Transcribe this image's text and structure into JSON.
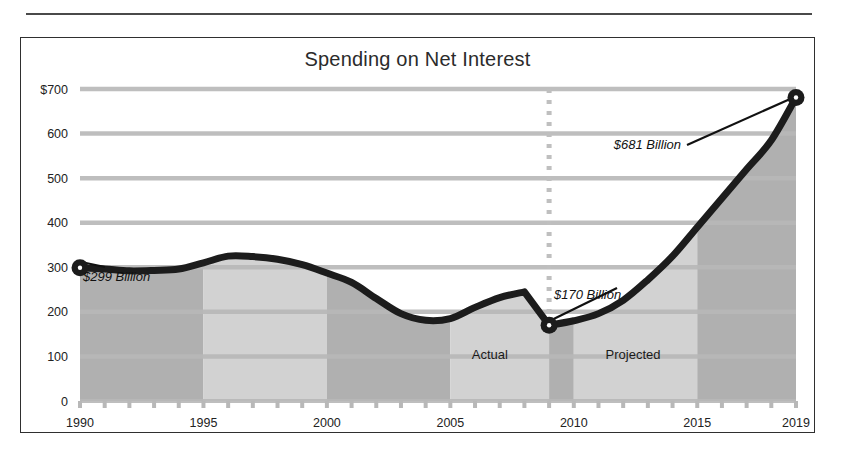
{
  "page": {
    "background_color": "#ffffff",
    "rule_color": "#4a4a4a"
  },
  "chart_frame": {
    "border_color": "#2f2f2f"
  },
  "chart_data": {
    "type": "area",
    "title": "Spending on Net Interest",
    "xlabel": "",
    "ylabel": "",
    "ylim": [
      0,
      700
    ],
    "xlim": [
      1990,
      2019
    ],
    "grid": true,
    "grid_color": "#b8b8b8",
    "legend_position": "none",
    "line_color": "#1c1c1c",
    "units": "Billions of dollars",
    "y_ticks": [
      "$700",
      "600",
      "500",
      "400",
      "300",
      "200",
      "100",
      "0"
    ],
    "y_tick_values": [
      700,
      600,
      500,
      400,
      300,
      200,
      100,
      0
    ],
    "x_ticks": [
      "1990",
      "1995",
      "2000",
      "2005",
      "2010",
      "2015",
      "2019"
    ],
    "x_tick_values": [
      1990,
      1995,
      2000,
      2005,
      2010,
      2015,
      2019
    ],
    "x": [
      1990,
      1991,
      1992,
      1993,
      1994,
      1995,
      1996,
      1997,
      1998,
      1999,
      2000,
      2001,
      2002,
      2003,
      2004,
      2005,
      2006,
      2007,
      2008,
      2009,
      2010,
      2011,
      2012,
      2013,
      2014,
      2015,
      2016,
      2017,
      2018,
      2019
    ],
    "values": [
      299,
      296,
      292,
      293,
      296,
      310,
      325,
      324,
      318,
      306,
      287,
      266,
      230,
      196,
      181,
      185,
      210,
      232,
      245,
      170,
      180,
      196,
      226,
      272,
      325,
      390,
      455,
      520,
      585,
      681
    ],
    "series": [
      {
        "name": "Spending on Net Interest",
        "values": [
          299,
          296,
          292,
          293,
          296,
          310,
          325,
          324,
          318,
          306,
          287,
          266,
          230,
          196,
          181,
          185,
          210,
          232,
          245,
          170,
          180,
          196,
          226,
          272,
          325,
          390,
          455,
          520,
          585,
          681
        ]
      }
    ],
    "bands": [
      {
        "from": 1990,
        "to": 1995,
        "shade": "dark"
      },
      {
        "from": 1995,
        "to": 2000,
        "shade": "light"
      },
      {
        "from": 2000,
        "to": 2005,
        "shade": "dark"
      },
      {
        "from": 2005,
        "to": 2009,
        "shade": "light"
      },
      {
        "from": 2009,
        "to": 2010,
        "shade": "dark"
      },
      {
        "from": 2010,
        "to": 2015,
        "shade": "light"
      },
      {
        "from": 2015,
        "to": 2019,
        "shade": "dark"
      }
    ],
    "band_dark_color": "#b0b0b0",
    "band_light_color": "#d2d2d2",
    "divider": {
      "year": 2009,
      "style": "dotted",
      "color": "#bfbfbf"
    },
    "annotations": [
      {
        "id": "start",
        "text": "$299 Billion",
        "year": 1990,
        "value": 299
      },
      {
        "id": "trough",
        "text": "$170 Billion",
        "year": 2009,
        "value": 170
      },
      {
        "id": "end",
        "text": "$681 Billion",
        "year": 2019,
        "value": 681
      }
    ],
    "period_labels": [
      {
        "text": "Actual",
        "center_year": 2006.6,
        "value": 95
      },
      {
        "text": "Projected",
        "center_year": 2012.4,
        "value": 95
      }
    ],
    "markers": [
      {
        "year": 1990,
        "value": 299
      },
      {
        "year": 2009,
        "value": 170
      },
      {
        "year": 2019,
        "value": 681
      }
    ]
  }
}
